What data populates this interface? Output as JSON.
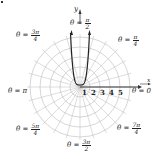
{
  "figure": {
    "type": "polar-graph",
    "center": {
      "x": 80,
      "y": 87
    },
    "ring_spacing_px": 10,
    "num_rings": 5,
    "num_spokes": 24,
    "colors": {
      "grid": "#bbbbbb",
      "curve": "#222222",
      "axis": "#333333"
    },
    "axis_labels": {
      "x": "x",
      "y": "y"
    },
    "radial_ticks": [
      "1",
      "2",
      "3",
      "4",
      "5"
    ],
    "angle_labels": {
      "pi_over_2": {
        "theta": "θ =",
        "num": "π",
        "den": "2"
      },
      "three_pi_over_4": {
        "theta": "θ =",
        "num": "3π",
        "den": "4"
      },
      "pi_over_4": {
        "theta": "θ =",
        "num": "π",
        "den": "4"
      },
      "pi": {
        "text": "θ = π"
      },
      "zero": {
        "text": "θ = 0"
      },
      "five_pi_over_4": {
        "theta": "θ =",
        "num": "5π",
        "den": "4"
      },
      "seven_pi_over_4": {
        "theta": "θ =",
        "num": "7π",
        "den": "4"
      },
      "three_pi_over_2": {
        "theta": "θ =",
        "num": "3π",
        "den": "2"
      }
    },
    "curve": "U-shaped curve through pole, opening upward toward θ = π/2"
  }
}
